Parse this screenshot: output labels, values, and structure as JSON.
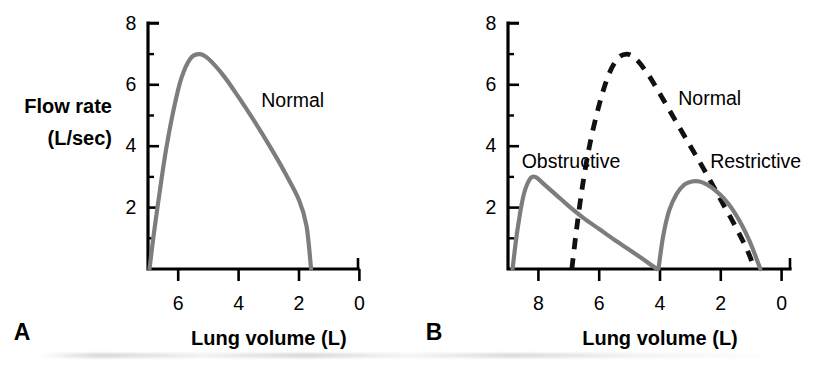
{
  "figure": {
    "background_color": "#ffffff",
    "curve_color_solid": "#7d7d7d",
    "curve_color_dashed": "#111111",
    "axis_color": "#000000"
  },
  "panels": [
    {
      "letter": "A",
      "y_axis_title_line1": "Flow rate",
      "y_axis_title_line2": "(L/sec)",
      "x_axis_title": "Lung volume (L)",
      "x_ticks": [
        "6",
        "4",
        "2",
        "0"
      ],
      "y_ticks": [
        "8",
        "6",
        "4",
        "2"
      ],
      "curve_labels": [
        "Normal"
      ]
    },
    {
      "letter": "B",
      "y_axis_title_line1": "",
      "y_axis_title_line2": "",
      "x_axis_title": "Lung volume (L)",
      "x_ticks": [
        "8",
        "6",
        "4",
        "2",
        "0"
      ],
      "y_ticks": [
        "8",
        "6",
        "4",
        "2"
      ],
      "curve_labels": [
        "Obstructive",
        "Normal",
        "Restrictive"
      ]
    }
  ],
  "chart_data": [
    {
      "type": "line",
      "panel": "A",
      "title": "",
      "xlabel": "Lung volume (L)",
      "ylabel": "Flow rate (L/sec)",
      "xlim": [
        7.0,
        0.0
      ],
      "ylim": [
        0,
        8
      ],
      "x_reversed": true,
      "xticks": [
        6,
        4,
        2,
        0
      ],
      "yticks": [
        8,
        6,
        4,
        2
      ],
      "grid": false,
      "legend": "inline-annotation",
      "series": [
        {
          "name": "Normal",
          "style": "solid",
          "color": "#7d7d7d",
          "label_position": {
            "x": 3.25,
            "y": 5.45
          },
          "x": [
            6.95,
            6.8,
            6.6,
            6.4,
            6.15,
            5.9,
            5.6,
            5.3,
            5.0,
            4.5,
            4.0,
            3.5,
            3.0,
            2.5,
            2.0,
            1.75,
            1.6
          ],
          "y": [
            0.0,
            1.2,
            2.6,
            3.9,
            5.2,
            6.2,
            6.85,
            7.0,
            6.85,
            6.3,
            5.6,
            4.85,
            4.05,
            3.2,
            2.25,
            1.4,
            0.0
          ]
        }
      ]
    },
    {
      "type": "line",
      "panel": "B",
      "title": "",
      "xlabel": "Lung volume (L)",
      "ylabel": "Flow rate (L/sec)",
      "xlim": [
        9.0,
        0.0
      ],
      "ylim": [
        0,
        8
      ],
      "x_reversed": true,
      "xticks": [
        8,
        6,
        4,
        2,
        0
      ],
      "yticks": [
        8,
        6,
        4,
        2
      ],
      "grid": false,
      "legend": "inline-annotation",
      "series": [
        {
          "name": "Obstructive",
          "style": "solid",
          "color": "#7d7d7d",
          "label_position": {
            "x": 8.55,
            "y": 3.45
          },
          "x": [
            8.85,
            8.7,
            8.5,
            8.3,
            8.1,
            7.8,
            7.4,
            7.0,
            6.5,
            6.0,
            5.5,
            5.0,
            4.6,
            4.3,
            4.1
          ],
          "y": [
            0.0,
            1.2,
            2.35,
            2.9,
            3.0,
            2.75,
            2.4,
            2.05,
            1.65,
            1.3,
            0.95,
            0.62,
            0.35,
            0.14,
            0.0
          ]
        },
        {
          "name": "Normal",
          "style": "dashed",
          "color": "#111111",
          "label_position": {
            "x": 3.4,
            "y": 5.5
          },
          "x": [
            6.9,
            6.75,
            6.55,
            6.3,
            6.0,
            5.7,
            5.4,
            5.1,
            4.8,
            4.4,
            4.0,
            3.5,
            3.0,
            2.5,
            2.0,
            1.5,
            1.1,
            0.9
          ],
          "y": [
            0.0,
            1.25,
            2.7,
            4.1,
            5.35,
            6.3,
            6.85,
            7.0,
            6.85,
            6.35,
            5.7,
            4.85,
            4.0,
            3.15,
            2.25,
            1.35,
            0.55,
            0.0
          ]
        },
        {
          "name": "Restrictive",
          "style": "solid",
          "color": "#7d7d7d",
          "label_position": {
            "x": 2.35,
            "y": 3.45
          },
          "x": [
            4.05,
            3.9,
            3.7,
            3.45,
            3.2,
            2.95,
            2.7,
            2.45,
            2.2,
            1.9,
            1.6,
            1.3,
            1.05,
            0.85,
            0.7
          ],
          "y": [
            0.0,
            1.05,
            1.9,
            2.45,
            2.75,
            2.85,
            2.85,
            2.75,
            2.58,
            2.3,
            1.92,
            1.42,
            0.9,
            0.4,
            0.0
          ]
        }
      ]
    }
  ]
}
